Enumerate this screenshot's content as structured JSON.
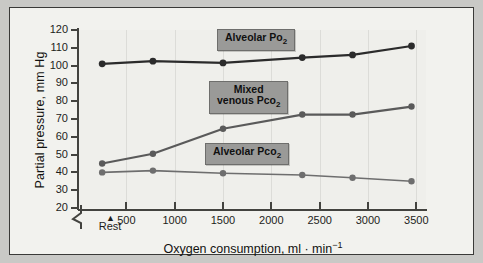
{
  "chart_data": {
    "type": "line",
    "title": "",
    "xlabel": "Oxygen consumption, ml · min⁻¹",
    "ylabel": "Partial pressure, mm Hg",
    "xlim": [
      0,
      3600
    ],
    "ylim": [
      20,
      120
    ],
    "xticks": [
      500,
      1000,
      1500,
      2000,
      2500,
      3000,
      3500
    ],
    "xticklabels": [
      "500",
      "1000",
      "1500",
      "2000",
      "2500",
      "3000",
      "3500"
    ],
    "yticks": [
      20,
      30,
      40,
      50,
      60,
      70,
      80,
      90,
      100,
      110,
      120
    ],
    "yticklabels": [
      "20",
      "30",
      "40",
      "50",
      "60",
      "70",
      "80",
      "90",
      "100",
      "110",
      "120"
    ],
    "grid": "vertical-faint",
    "legend": "inline-callouts",
    "y_axis_break": true,
    "x": [
      250,
      775,
      1500,
      2320,
      2840,
      3450
    ],
    "annotations": [
      {
        "text": "Rest",
        "x": 250,
        "marker": "▲"
      }
    ],
    "series": [
      {
        "name": "Alveolar Po2",
        "label": "Alveolar Po",
        "label_sub": "2",
        "color": "#2b2b2b",
        "values": [
          101,
          102.5,
          101.5,
          104.5,
          106,
          111
        ]
      },
      {
        "name": "Mixed venous Pco2",
        "label_line1": "Mixed",
        "label_line2": "venous Pco",
        "label_sub": "2",
        "color": "#5a5a5a",
        "values": [
          45,
          50.5,
          64.5,
          72.5,
          72.5,
          77
        ]
      },
      {
        "name": "Alveolar Pco2",
        "label": "Alveolar Pco",
        "label_sub": "2",
        "color": "#6e6e6e",
        "values": [
          40,
          41,
          39.5,
          38.5,
          37,
          35
        ]
      }
    ]
  }
}
